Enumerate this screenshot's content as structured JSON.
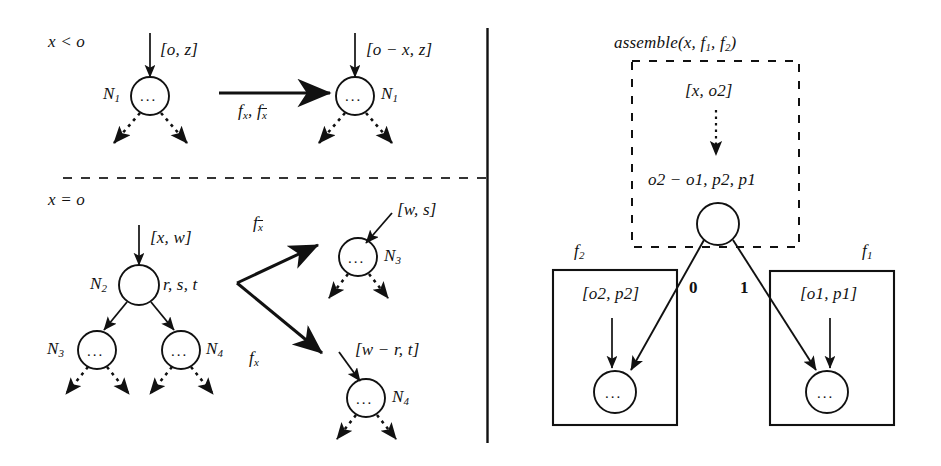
{
  "figure": {
    "background_color": "#ffffff",
    "ink_color": "#111111",
    "dividers": {
      "vertical_name": "panel-divider-vertical",
      "horizontal_name": "panel-divider-dashed"
    }
  },
  "left_panel": {
    "rule_top": {
      "condition": "x < o",
      "source": {
        "incoming_label": "[o, z]",
        "node_name": "N",
        "node_sub": "1",
        "node_glyph": "..."
      },
      "arrow_label_a": "f",
      "arrow_label_a_sub": "x",
      "arrow_label_b": "f",
      "arrow_label_b_sub": "x",
      "target": {
        "incoming_label": "[o − x, z]",
        "node_name": "N",
        "node_sub": "1",
        "node_glyph": "..."
      }
    },
    "rule_bottom": {
      "condition": "x = o",
      "source": {
        "incoming_label": "[x, w]",
        "node_name": "N",
        "node_sub": "2",
        "side_label": "r, s, t",
        "child_left_name": "N",
        "child_left_sub": "3",
        "child_right_name": "N",
        "child_right_sub": "4",
        "node_glyph": "..."
      },
      "branch_up": {
        "edge_label": "f",
        "edge_label_sub": "x",
        "edge_label_overline": true,
        "incoming_label": "[w, s]",
        "node_name": "N",
        "node_sub": "3",
        "node_glyph": "..."
      },
      "branch_down": {
        "edge_label": "f",
        "edge_label_sub": "x",
        "edge_label_overline": false,
        "incoming_label": "[w − r, t]",
        "node_name": "N",
        "node_sub": "4",
        "node_glyph": "..."
      }
    }
  },
  "right_panel": {
    "assemble_box": {
      "title_fn": "assemble",
      "title_args": "(x, f",
      "title_sub1": "1",
      "title_mid": ", f",
      "title_sub2": "2",
      "title_close": ")",
      "incoming_label": "[x, o2]",
      "node_attrs": "o2 − o1, p2, p1"
    },
    "edges": {
      "left_label": "0",
      "right_label": "1"
    },
    "sub_f2": {
      "box_label": "f",
      "box_label_sub": "2",
      "incoming_label": "[o2, p2]",
      "node_glyph": "..."
    },
    "sub_f1": {
      "box_label": "f",
      "box_label_sub": "1",
      "incoming_label": "[o1, p1]",
      "node_glyph": "..."
    }
  }
}
